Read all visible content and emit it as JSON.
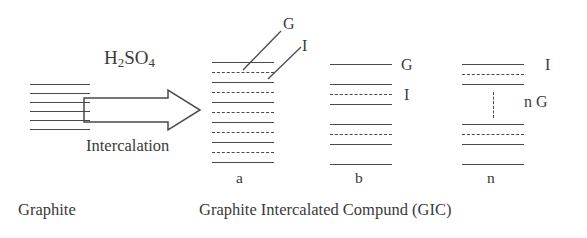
{
  "figure": {
    "reagent_label": "H",
    "reagent_sub1": "2",
    "reagent_mid": "SO",
    "reagent_sub2": "4",
    "process_label": "Intercalation",
    "source_label": "Graphite",
    "product_caption": "Graphite Intercalated Compund (GIC)",
    "arrow_name": "intercalation-arrow"
  },
  "callouts": {
    "graphene_top": "G",
    "intercalant_top": "I",
    "stage_b_graphene": "G",
    "stage_b_intercalant": "I",
    "stage_n_intercalant": "I",
    "stage_n_graphene": "n G"
  },
  "stages": [
    {
      "id": "a",
      "label": "a"
    },
    {
      "id": "b",
      "label": "b"
    },
    {
      "id": "n",
      "label": "n"
    }
  ],
  "chart_data": {
    "type": "diagram",
    "legend": [
      {
        "symbol": "G",
        "meaning": "graphene layer",
        "stroke": "solid"
      },
      {
        "symbol": "I",
        "meaning": "intercalant layer",
        "stroke": "dashed"
      }
    ],
    "stacks": [
      {
        "name": "graphite",
        "x": 30,
        "width": 60,
        "layers": [
          {
            "y": 84,
            "type": "solid"
          },
          {
            "y": 93,
            "type": "solid"
          },
          {
            "y": 102,
            "type": "solid"
          },
          {
            "y": 111,
            "type": "solid"
          },
          {
            "y": 120,
            "type": "solid"
          },
          {
            "y": 129,
            "type": "solid"
          }
        ]
      },
      {
        "name": "stage-a",
        "x": 212,
        "width": 62,
        "layers": [
          {
            "y": 62,
            "type": "solid"
          },
          {
            "y": 72,
            "type": "dashed"
          },
          {
            "y": 82,
            "type": "solid"
          },
          {
            "y": 92,
            "type": "dashed"
          },
          {
            "y": 102,
            "type": "solid"
          },
          {
            "y": 112,
            "type": "dashed"
          },
          {
            "y": 122,
            "type": "solid"
          },
          {
            "y": 132,
            "type": "dashed"
          },
          {
            "y": 142,
            "type": "solid"
          },
          {
            "y": 152,
            "type": "dashed"
          },
          {
            "y": 162,
            "type": "solid"
          }
        ]
      },
      {
        "name": "stage-b",
        "x": 330,
        "width": 62,
        "layers": [
          {
            "y": 64,
            "type": "solid"
          },
          {
            "y": 84,
            "type": "solid"
          },
          {
            "y": 94,
            "type": "dashed"
          },
          {
            "y": 104,
            "type": "solid"
          },
          {
            "y": 124,
            "type": "solid"
          },
          {
            "y": 134,
            "type": "dashed"
          },
          {
            "y": 144,
            "type": "solid"
          },
          {
            "y": 164,
            "type": "solid"
          }
        ]
      },
      {
        "name": "stage-n",
        "x": 462,
        "width": 62,
        "layers": [
          {
            "y": 64,
            "type": "solid"
          },
          {
            "y": 74,
            "type": "dashed"
          },
          {
            "y": 84,
            "type": "solid"
          },
          {
            "y": 124,
            "type": "solid"
          },
          {
            "y": 134,
            "type": "dashed"
          },
          {
            "y": 144,
            "type": "solid"
          },
          {
            "y": 164,
            "type": "solid"
          }
        ],
        "repeat_rule": {
          "x": 493,
          "y_top": 92,
          "y_bottom": 118
        }
      }
    ],
    "leader_lines": [
      {
        "from": [
          243,
          70
        ],
        "to": [
          281,
          31
        ],
        "label": "G"
      },
      {
        "from": [
          268,
          79
        ],
        "to": [
          300,
          48
        ],
        "label": "I"
      }
    ]
  }
}
